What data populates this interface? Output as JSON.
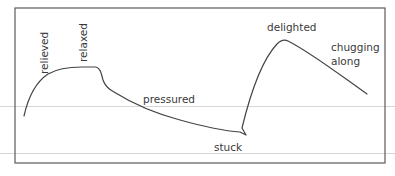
{
  "diagram": {
    "type": "emotional journey curve",
    "frame": {
      "stroke": "#5a5a5a"
    },
    "curve": {
      "stroke": "#444444"
    },
    "guide_lines": {
      "color": "#d6d6d6"
    },
    "labels": {
      "relieved": "relieved",
      "relaxed": "relaxed",
      "pressured": "pressured",
      "stuck": "stuck",
      "delighted": "delighted",
      "chugging_line1": "chugging",
      "chugging_line2": "along"
    }
  }
}
